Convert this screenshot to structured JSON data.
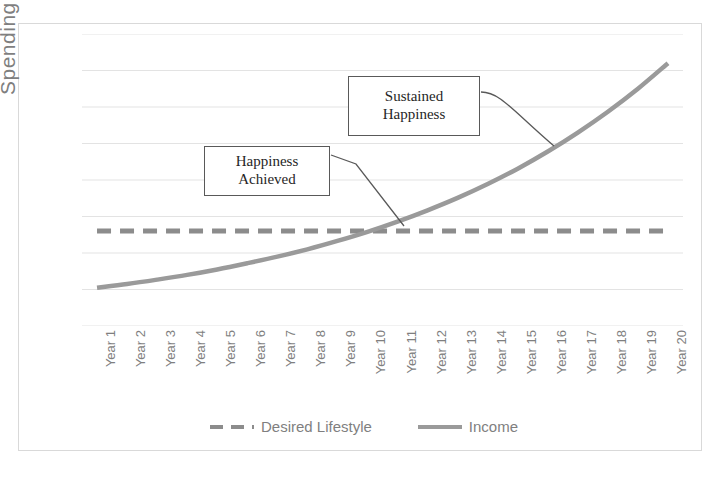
{
  "chart_data": {
    "type": "line",
    "title": "",
    "xlabel": "",
    "ylabel": "Spending",
    "grid": true,
    "legend_position": "bottom",
    "categories": [
      "Year 1",
      "Year 2",
      "Year 3",
      "Year 4",
      "Year 5",
      "Year 6",
      "Year 7",
      "Year 8",
      "Year 9",
      "Year 10",
      "Year 11",
      "Year 12",
      "Year 13",
      "Year 14",
      "Year 15",
      "Year 16",
      "Year 17",
      "Year 18",
      "Year 19",
      "Year 20"
    ],
    "ylim": [
      0,
      8
    ],
    "yticks": [
      0,
      1,
      2,
      3,
      4,
      5,
      6,
      7,
      8
    ],
    "ytick_labels": [],
    "series": [
      {
        "name": "Desired Lifestyle",
        "style": "dashed",
        "color": "#8c8c8c",
        "values": [
          2.6,
          2.6,
          2.6,
          2.6,
          2.6,
          2.6,
          2.6,
          2.6,
          2.6,
          2.6,
          2.6,
          2.6,
          2.6,
          2.6,
          2.6,
          2.6,
          2.6,
          2.6,
          2.6,
          2.6
        ]
      },
      {
        "name": "Income",
        "style": "solid",
        "color": "#9a9a9a",
        "values": [
          1.05,
          1.15,
          1.27,
          1.4,
          1.55,
          1.72,
          1.9,
          2.1,
          2.33,
          2.58,
          2.86,
          3.17,
          3.51,
          3.89,
          4.31,
          4.78,
          5.3,
          5.87,
          6.5,
          7.2
        ]
      }
    ],
    "annotations": [
      {
        "name": "happiness-achieved",
        "line1": "Happiness",
        "line2": "Achieved",
        "points_to_category": "Year 11"
      },
      {
        "name": "sustained-happiness",
        "line1": "Sustained",
        "line2": "Happiness",
        "points_to_category": "Year 16"
      }
    ]
  },
  "axes": {
    "y_title": "Spending"
  },
  "legend": {
    "items": [
      {
        "label": "Desired Lifestyle",
        "style": "dashed"
      },
      {
        "label": "Income",
        "style": "solid"
      }
    ]
  },
  "colors": {
    "desired_lifestyle": "#8c8c8c",
    "income": "#9a9a9a",
    "gridline": "#e3e3e3",
    "frame": "#d9d9d9",
    "callout_border": "#595959",
    "text": "#7f7f7f"
  }
}
